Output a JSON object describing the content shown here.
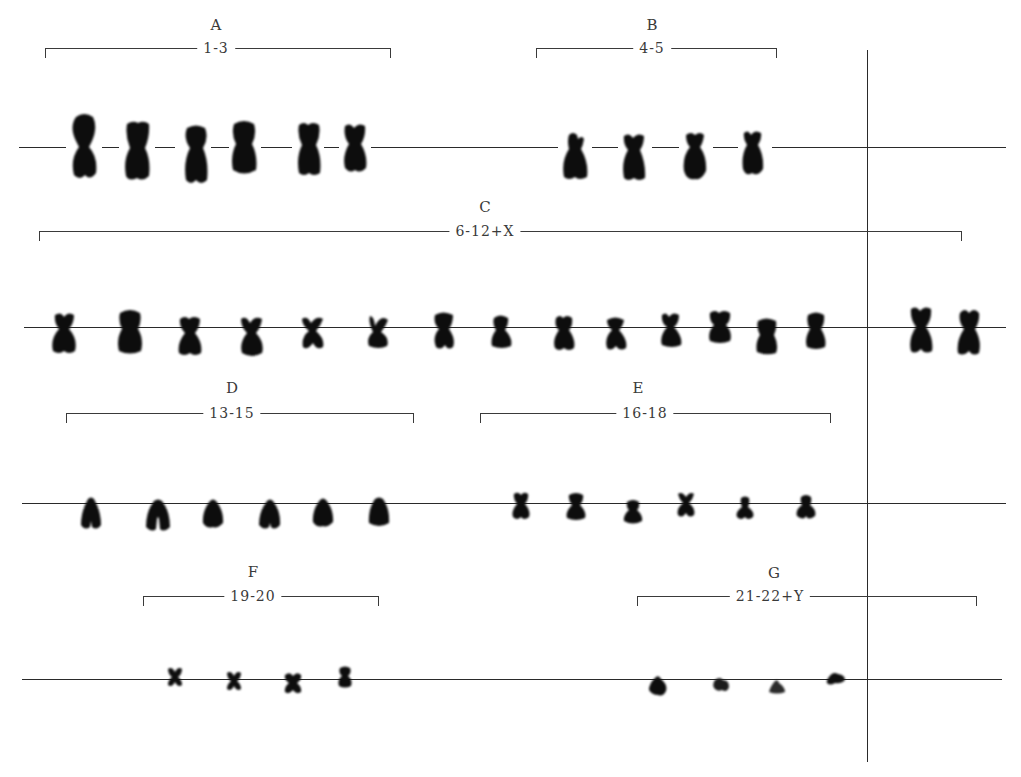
{
  "figure": {
    "colors": {
      "background": "#ffffff",
      "line": "#2a2a2a",
      "chromosome": "#0d0d0d",
      "text": "#3a3a3a"
    }
  },
  "groups": [
    {
      "letter": "A",
      "range": "1-3",
      "row": 1,
      "count": 6
    },
    {
      "letter": "B",
      "range": "4-5",
      "row": 1,
      "count": 4
    },
    {
      "letter": "C",
      "range": "6-12+X",
      "row": 2,
      "count": 14,
      "sex_chromosomes_beyond_divider": 2
    },
    {
      "letter": "D",
      "range": "13-15",
      "row": 3,
      "count": 6
    },
    {
      "letter": "E",
      "range": "16-18",
      "row": 3,
      "count": 6
    },
    {
      "letter": "F",
      "range": "19-20",
      "row": 4,
      "count": 4
    },
    {
      "letter": "G",
      "range": "21-22+Y",
      "row": 4,
      "count": 4
    }
  ],
  "divider": {
    "description": "vertical line separating sex chromosomes",
    "x": 868
  }
}
